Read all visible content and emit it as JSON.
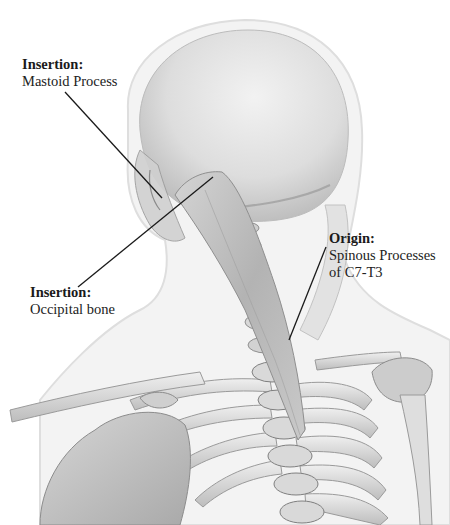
{
  "figure": {
    "labels": [
      {
        "id": "insertion-mastoid",
        "title": "Insertion",
        "colon": ":",
        "lines": [
          "Mastoid Process"
        ],
        "position": {
          "x": 22,
          "y": 60
        },
        "leader": {
          "x1": 65,
          "y1": 92,
          "x2": 162,
          "y2": 198
        }
      },
      {
        "id": "insertion-occipital",
        "title": "Insertion",
        "colon": ":",
        "lines": [
          "Occipital bone"
        ],
        "position": {
          "x": 30,
          "y": 285
        },
        "leader": {
          "x1": 78,
          "y1": 287,
          "x2": 213,
          "y2": 177
        }
      },
      {
        "id": "origin",
        "title": "Origin",
        "colon": ":",
        "lines": [
          "Spinous Processes",
          "of C7-T3"
        ],
        "position": {
          "x": 328,
          "y": 231
        },
        "leader": {
          "x1": 326,
          "y1": 247,
          "x2": 289,
          "y2": 340
        }
      }
    ],
    "colors": {
      "background": "#ffffff",
      "skin_silhouette": "#f1f1f1",
      "skin_edge": "#dcdcdc",
      "bone_light": "#e8e8e8",
      "bone_mid": "#c9c9c9",
      "bone_dark": "#8e8e8e",
      "muscle": "#b9b9b9",
      "leader_line": "#1a1a1a",
      "text": "#222222"
    }
  }
}
